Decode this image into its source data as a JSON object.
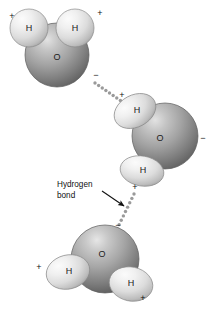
{
  "figure": {
    "width": 213,
    "height": 313,
    "background": "#ffffff"
  },
  "palette": {
    "oxygen_light": "#d8d8d8",
    "oxygen_mid": "#a6a6a6",
    "oxygen_dark": "#6f6f6f",
    "oxygen_edge": "#5c5c5c",
    "hydrogen_light": "#f4f4f4",
    "hydrogen_mid": "#dcdcdc",
    "hydrogen_dark": "#a9a9a9",
    "hydrogen_edge": "#8a8a8a",
    "bond_dot": "#9a9a9a",
    "text": "#111111",
    "arrow": "#111111"
  },
  "molecules": [
    {
      "id": "water-top",
      "name": "water-molecule-top",
      "oxygen": {
        "label": "O",
        "cx": 57,
        "cy": 55,
        "r": 32,
        "label_x": 57,
        "label_y": 58
      },
      "hydrogens": [
        {
          "label": "H",
          "cx": 29,
          "cy": 28,
          "rx": 19,
          "ry": 19,
          "rotate": 0,
          "label_x": 29,
          "label_y": 29
        },
        {
          "label": "H",
          "cx": 75,
          "cy": 28,
          "rx": 19,
          "ry": 19,
          "rotate": 0,
          "label_x": 75,
          "label_y": 29
        }
      ],
      "charges": [
        {
          "sign": "+",
          "x": 12,
          "y": 17,
          "name": "charge-positive-top-left"
        },
        {
          "sign": "+",
          "x": 100,
          "y": 14,
          "name": "charge-positive-top-right"
        },
        {
          "sign": "−",
          "x": 96,
          "y": 76,
          "name": "charge-negative-top-oxygen"
        }
      ]
    },
    {
      "id": "water-middle",
      "name": "water-molecule-middle",
      "oxygen": {
        "label": "O",
        "cx": 165,
        "cy": 136,
        "r": 33,
        "label_x": 160,
        "label_y": 139
      },
      "hydrogens": [
        {
          "label": "H",
          "cx": 135,
          "cy": 111,
          "rx": 22,
          "ry": 16,
          "rotate": -28,
          "label_x": 137,
          "label_y": 111
        },
        {
          "label": "H",
          "cx": 142,
          "cy": 171,
          "rx": 22,
          "ry": 15,
          "rotate": 10,
          "label_x": 143,
          "label_y": 171
        }
      ],
      "charges": [
        {
          "sign": "+",
          "x": 122,
          "y": 96,
          "name": "charge-positive-middle-upper-h"
        },
        {
          "sign": "+",
          "x": 135,
          "y": 188,
          "name": "charge-positive-middle-lower-h"
        },
        {
          "sign": "−",
          "x": 203,
          "y": 139,
          "name": "charge-negative-middle-oxygen"
        }
      ]
    },
    {
      "id": "water-bottom",
      "name": "water-molecule-bottom",
      "oxygen": {
        "label": "O",
        "cx": 105,
        "cy": 259,
        "r": 34,
        "label_x": 102,
        "label_y": 255
      },
      "hydrogens": [
        {
          "label": "H",
          "cx": 68,
          "cy": 272,
          "rx": 22,
          "ry": 17,
          "rotate": -14,
          "label_x": 69,
          "label_y": 272
        },
        {
          "label": "H",
          "cx": 131,
          "cy": 284,
          "rx": 22,
          "ry": 17,
          "rotate": 12,
          "label_x": 131,
          "label_y": 284
        }
      ],
      "charges": [
        {
          "sign": "+",
          "x": 39,
          "y": 268,
          "name": "charge-positive-bottom-left"
        },
        {
          "sign": "+",
          "x": 143,
          "y": 299,
          "name": "charge-positive-bottom-right"
        },
        {
          "sign": "−",
          "x": 118,
          "y": 226,
          "name": "charge-negative-bottom-oxygen"
        }
      ]
    }
  ],
  "hydrogen_bonds": [
    {
      "name": "hydrogen-bond-upper",
      "x1": 95,
      "y1": 83,
      "x2": 124,
      "y2": 103,
      "dot_count": 9,
      "dot_radius": 1.7
    },
    {
      "name": "hydrogen-bond-lower",
      "x1": 134,
      "y1": 194,
      "x2": 117,
      "y2": 229,
      "dot_count": 9,
      "dot_radius": 1.7
    }
  ],
  "annotation": {
    "name": "hydrogen-bond-callout",
    "line1": "Hydrogen",
    "line2": "bond",
    "line1_x": 57,
    "line1_y": 185,
    "line2_x": 57,
    "line2_y": 196,
    "arrow": {
      "x1": 102,
      "y1": 191,
      "x2": 124,
      "y2": 206
    }
  }
}
